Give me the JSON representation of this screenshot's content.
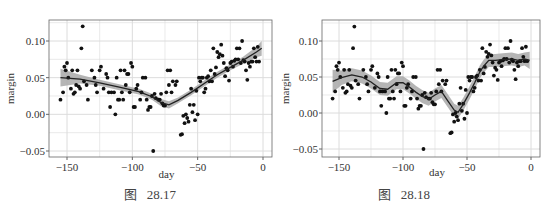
{
  "figures": [
    {
      "caption": "图   28.17",
      "method": "loess (smooth, wide span)"
    },
    {
      "caption": "图   28.18",
      "method": "loess (smooth, narrow span)"
    }
  ],
  "chart_data": [
    {
      "type": "scatter",
      "title": "",
      "caption": "图 28.17",
      "xlabel": "day",
      "ylabel": "margin",
      "xlim": [
        -158,
        2
      ],
      "ylim": [
        -0.055,
        0.13
      ],
      "xticks": [
        -150,
        -100,
        -50,
        0
      ],
      "xtick_labels": [
        "−150",
        "−100",
        "−50",
        "0"
      ],
      "yticks": [
        -0.05,
        0.0,
        0.05,
        0.1
      ],
      "ytick_labels": [
        "−0.05",
        "0.00",
        "0.05",
        "0.10"
      ],
      "grid": true,
      "legend": null,
      "points": [
        [
          -155,
          0.02
        ],
        [
          -153,
          0.03
        ],
        [
          -152,
          0.065
        ],
        [
          -151,
          0.06
        ],
        [
          -150,
          0.07
        ],
        [
          -149,
          0.05
        ],
        [
          -147,
          0.035
        ],
        [
          -146,
          0.06
        ],
        [
          -145,
          0.028
        ],
        [
          -144,
          0.03
        ],
        [
          -143,
          0.04
        ],
        [
          -142,
          0.06
        ],
        [
          -141,
          0.038
        ],
        [
          -140,
          0.035
        ],
        [
          -139,
          0.09
        ],
        [
          -138,
          0.12
        ],
        [
          -137,
          0.045
        ],
        [
          -135,
          0.04
        ],
        [
          -134,
          0.02
        ],
        [
          -131,
          0.06
        ],
        [
          -129,
          0.05
        ],
        [
          -128,
          0.04
        ],
        [
          -127,
          0.03
        ],
        [
          -125,
          0.06
        ],
        [
          -124,
          0.065
        ],
        [
          -122,
          0.035
        ],
        [
          -120,
          0.055
        ],
        [
          -119,
          0.05
        ],
        [
          -118,
          0.03
        ],
        [
          -117,
          0.01
        ],
        [
          -116,
          0.03
        ],
        [
          -114,
          0.03
        ],
        [
          -113,
          0.0
        ],
        [
          -112,
          0.05
        ],
        [
          -111,
          0.02
        ],
        [
          -110,
          0.02
        ],
        [
          -109,
          0.06
        ],
        [
          -108,
          0.03
        ],
        [
          -107,
          0.02
        ],
        [
          -106,
          0.06
        ],
        [
          -105,
          0.04
        ],
        [
          -104,
          0.055
        ],
        [
          -103,
          0.055
        ],
        [
          -102,
          0.03
        ],
        [
          -101,
          0.07
        ],
        [
          -100,
          0.065
        ],
        [
          -99,
          0.01
        ],
        [
          -98,
          0.01
        ],
        [
          -97,
          0.035
        ],
        [
          -96,
          0.04
        ],
        [
          -94,
          0.02
        ],
        [
          -93,
          0.03
        ],
        [
          -92,
          0.05
        ],
        [
          -90,
          0.05
        ],
        [
          -89,
          0.02
        ],
        [
          -88,
          0.006
        ],
        [
          -87,
          0.01
        ],
        [
          -86,
          0.01
        ],
        [
          -85,
          0.025
        ],
        [
          -84,
          -0.05
        ],
        [
          -83,
          0.028
        ],
        [
          -82,
          0.022
        ],
        [
          -80,
          0.02
        ],
        [
          -79,
          0.02
        ],
        [
          -78,
          0.028
        ],
        [
          -77,
          0.015
        ],
        [
          -76,
          0.012
        ],
        [
          -75,
          0.012
        ],
        [
          -74,
          0.03
        ],
        [
          -73,
          0.06
        ],
        [
          -72,
          0.04
        ],
        [
          -71,
          0.06
        ],
        [
          -70,
          0.03
        ],
        [
          -69,
          0.045
        ],
        [
          -67,
          0.04
        ],
        [
          -66,
          0.045
        ],
        [
          -63,
          -0.028
        ],
        [
          -62,
          -0.027
        ],
        [
          -61,
          -0.002
        ],
        [
          -60,
          -0.012
        ],
        [
          -59,
          0.0
        ],
        [
          -58,
          -0.005
        ],
        [
          -57,
          -0.01
        ],
        [
          -56,
          0.013
        ],
        [
          -55,
          0.035
        ],
        [
          -54,
          0.003
        ],
        [
          -53,
          0.013
        ],
        [
          -52,
          -0.008
        ],
        [
          -51,
          0.032
        ],
        [
          -50,
          0.0
        ],
        [
          -49,
          0.05
        ],
        [
          -48,
          0.045
        ],
        [
          -47,
          0.05
        ],
        [
          -46,
          0.05
        ],
        [
          -45,
          0.03
        ],
        [
          -44,
          0.035
        ],
        [
          -43,
          0.05
        ],
        [
          -42,
          0.052
        ],
        [
          -41,
          0.045
        ],
        [
          -40,
          0.06
        ],
        [
          -39,
          0.045
        ],
        [
          -38,
          0.09
        ],
        [
          -37,
          0.055
        ],
        [
          -36,
          0.064
        ],
        [
          -35,
          0.085
        ],
        [
          -34,
          0.078
        ],
        [
          -33,
          0.082
        ],
        [
          -32,
          0.095
        ],
        [
          -31,
          0.08
        ],
        [
          -30,
          0.07
        ],
        [
          -29,
          0.052
        ],
        [
          -28,
          0.063
        ],
        [
          -27,
          0.06
        ],
        [
          -26,
          0.046
        ],
        [
          -25,
          0.07
        ],
        [
          -24,
          0.072
        ],
        [
          -23,
          0.065
        ],
        [
          -22,
          0.073
        ],
        [
          -21,
          0.075
        ],
        [
          -20,
          0.09
        ],
        [
          -19,
          0.075
        ],
        [
          -18,
          0.09
        ],
        [
          -17,
          0.07
        ],
        [
          -16,
          0.1
        ],
        [
          -15,
          0.074
        ],
        [
          -14,
          0.072
        ],
        [
          -13,
          0.06
        ],
        [
          -12,
          0.047
        ],
        [
          -11,
          0.07
        ],
        [
          -10,
          0.065
        ],
        [
          -9,
          0.072
        ],
        [
          -8,
          0.072
        ],
        [
          -7,
          0.09
        ],
        [
          -6,
          0.078
        ],
        [
          -5,
          0.072
        ],
        [
          -4,
          0.092
        ],
        [
          -3,
          0.072
        ]
      ],
      "smooth": {
        "x": [
          -155,
          -140,
          -125,
          -110,
          -95,
          -85,
          -78,
          -72,
          -65,
          -55,
          -45,
          -35,
          -25,
          -15,
          -5,
          -1
        ],
        "y": [
          0.05,
          0.048,
          0.043,
          0.037,
          0.031,
          0.024,
          0.016,
          0.013,
          0.019,
          0.03,
          0.042,
          0.054,
          0.064,
          0.074,
          0.085,
          0.09
        ],
        "ci_halfwidth": [
          0.012,
          0.006,
          0.004,
          0.004,
          0.004,
          0.004,
          0.005,
          0.005,
          0.004,
          0.004,
          0.004,
          0.004,
          0.004,
          0.005,
          0.007,
          0.01
        ]
      }
    },
    {
      "type": "scatter",
      "title": "",
      "caption": "图 28.18",
      "xlabel": "day",
      "ylabel": "margin",
      "xlim": [
        -158,
        2
      ],
      "ylim": [
        -0.055,
        0.13
      ],
      "xticks": [
        -150,
        -100,
        -50,
        0
      ],
      "xtick_labels": [
        "−150",
        "−100",
        "−50",
        "0"
      ],
      "yticks": [
        -0.05,
        0.0,
        0.05,
        0.1
      ],
      "ytick_labels": [
        "−0.05",
        "0.00",
        "0.05",
        "0.10"
      ],
      "grid": true,
      "legend": null,
      "points_same_as": 0,
      "smooth": {
        "x": [
          -155,
          -148,
          -140,
          -132,
          -125,
          -118,
          -112,
          -105,
          -100,
          -95,
          -90,
          -85,
          -80,
          -75,
          -70,
          -65,
          -60,
          -57,
          -53,
          -48,
          -44,
          -40,
          -37,
          -33,
          -28,
          -22,
          -15,
          -10,
          -5,
          -1
        ],
        "y": [
          0.044,
          0.049,
          0.053,
          0.05,
          0.043,
          0.034,
          0.033,
          0.042,
          0.042,
          0.036,
          0.029,
          0.023,
          0.019,
          0.025,
          0.03,
          0.017,
          0.004,
          0.001,
          0.012,
          0.028,
          0.042,
          0.057,
          0.065,
          0.073,
          0.073,
          0.074,
          0.075,
          0.073,
          0.075,
          0.073
        ],
        "ci_halfwidth": [
          0.016,
          0.01,
          0.009,
          0.009,
          0.009,
          0.009,
          0.009,
          0.009,
          0.009,
          0.009,
          0.009,
          0.009,
          0.009,
          0.009,
          0.009,
          0.009,
          0.009,
          0.009,
          0.009,
          0.009,
          0.009,
          0.009,
          0.009,
          0.009,
          0.009,
          0.009,
          0.009,
          0.009,
          0.009,
          0.012
        ]
      }
    }
  ],
  "colors": {
    "point": "#111111",
    "smooth_line": "#222222",
    "ci_band": "#a8a8a8",
    "grid": "#dcdcdc",
    "axis": "#666666",
    "panel_bg": "#ffffff"
  }
}
